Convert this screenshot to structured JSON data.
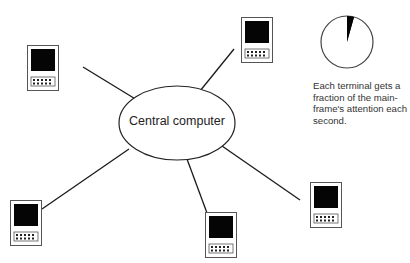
{
  "diagram": {
    "central_node": {
      "label": "Central computer"
    },
    "terminals": [
      {
        "id": "terminal-top-left",
        "x": 27,
        "y": 45
      },
      {
        "id": "terminal-top-right",
        "x": 241,
        "y": 17
      },
      {
        "id": "terminal-bottom-left",
        "x": 10,
        "y": 200
      },
      {
        "id": "terminal-bottom-center",
        "x": 205,
        "y": 212
      },
      {
        "id": "terminal-right",
        "x": 310,
        "y": 182
      }
    ],
    "pie_indicator": {
      "description": "time slice",
      "slice_degrees": 15
    },
    "caption": "Each terminal gets a fraction of the main-frame's attention each second.",
    "colors": {
      "line": "#1a1a1a",
      "screen": "#050505",
      "frame": "#444444"
    }
  }
}
